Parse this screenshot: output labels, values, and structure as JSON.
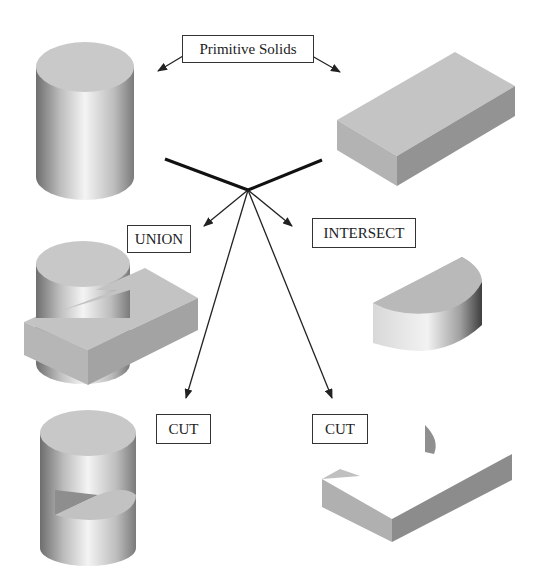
{
  "title_label": "Primitive Solids",
  "operations": {
    "union": "UNION",
    "intersect": "INTERSECT",
    "cut_left": "CUT",
    "cut_right": "CUT"
  },
  "shapes": {
    "primitive_1": "cylinder",
    "primitive_2": "rectangular block",
    "union_result": "cylinder joined with block",
    "intersect_result": "half-cylinder segment",
    "cut_left_result": "cylinder with wedge notch",
    "cut_right_result": "block with cylindrical cutout"
  },
  "colors": {
    "line": "#222222",
    "face_light": "#c8c8c8",
    "face_mid": "#a9a9a9",
    "face_dark": "#8a8a8a"
  }
}
